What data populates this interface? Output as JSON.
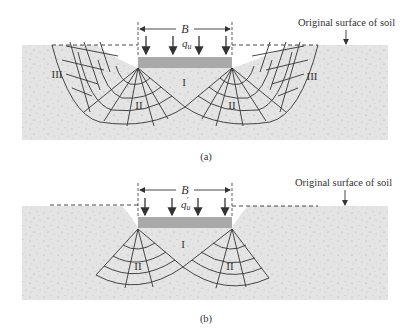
{
  "figure": {
    "panels": [
      {
        "id": "a",
        "caption": "(a)",
        "width_label": "B",
        "load_label": "q",
        "load_subscript": "u",
        "load_prime": "",
        "surface_label": "Original surface of soil",
        "zones": {
          "center": "I",
          "radial_left": "II",
          "radial_right": "II",
          "passive_left": "III",
          "passive_right": "III"
        }
      },
      {
        "id": "b",
        "caption": "(b)",
        "width_label": "B",
        "load_label": "q",
        "load_subscript": "u",
        "load_prime": "′",
        "surface_label": "Original surface of soil",
        "zones": {
          "center": "I",
          "radial_left": "II",
          "radial_right": "II"
        }
      }
    ]
  },
  "colors": {
    "soil": "#e4e4e4",
    "footing": "#a9a9a9",
    "lines": "#333333",
    "background": "#ffffff"
  }
}
